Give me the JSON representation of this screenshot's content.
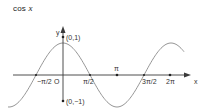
{
  "title": {
    "func": "cos",
    "var": "x"
  },
  "axes": {
    "x_label": "x",
    "y_label": "y",
    "origin_label": "O",
    "color": "#3a3a3a"
  },
  "points": [
    {
      "label": "(0,1)",
      "x": 0,
      "y": 1
    },
    {
      "label": "(0,−1)",
      "x": 0,
      "y": -1
    }
  ],
  "ticks": [
    {
      "label": "−π/2",
      "value": -1.5708
    },
    {
      "label": "π/2",
      "value": 1.5708
    },
    {
      "label": "π",
      "value": 3.1416
    },
    {
      "label": "3π/2",
      "value": 4.7124
    },
    {
      "label": "2π",
      "value": 6.2832
    }
  ],
  "curve_color": "#8a8a8a",
  "chart_data": {
    "type": "line",
    "title": "cos x",
    "xlabel": "x",
    "ylabel": "y",
    "function": "y = cos(x)",
    "x_tick_labels": [
      "-π/2",
      "π/2",
      "π",
      "3π/2",
      "2π"
    ],
    "x_tick_values": [
      -1.5708,
      1.5708,
      3.1416,
      4.7124,
      6.2832
    ],
    "annotated_points": [
      {
        "label": "(0,1)",
        "x": 0,
        "y": 1
      },
      {
        "label": "(0,-1)",
        "x": 0,
        "y": -1
      }
    ],
    "xlim": [
      -2.9,
      7.2
    ],
    "ylim": [
      -1.1,
      1.1
    ],
    "series": [
      {
        "name": "cos x",
        "x": [
          -2.5,
          -1.5708,
          0,
          1.5708,
          3.1416,
          4.7124,
          6.2832,
          7.0
        ],
        "y": [
          -0.8,
          0,
          1,
          0,
          -1,
          0,
          1,
          0.75
        ]
      }
    ],
    "grid": false,
    "legend": false
  }
}
